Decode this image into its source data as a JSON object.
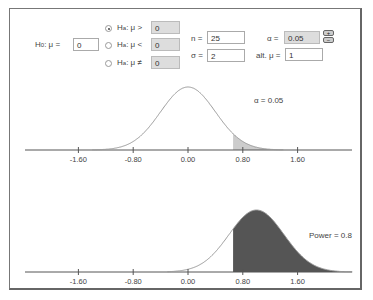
{
  "controls": {
    "h0_label": "H",
    "h0_sub": "0",
    "h0_mu": ": μ =",
    "h0_value": "0",
    "alternatives": [
      {
        "label_pre": "H",
        "label_sub": "a",
        "label_post": ": μ >",
        "value": "0",
        "selected": true
      },
      {
        "label_pre": "H",
        "label_sub": "a",
        "label_post": ": μ <",
        "value": "0",
        "selected": false
      },
      {
        "label_pre": "H",
        "label_sub": "a",
        "label_post": ": μ ≠",
        "value": "0",
        "selected": false
      }
    ],
    "n_label": "n =",
    "n_value": "25",
    "sigma_label": "σ =",
    "sigma_value": "2",
    "alpha_label": "α =",
    "alpha_value": "0.05",
    "alt_mu_label": "alt. μ =",
    "alt_mu_value": "1",
    "spin_up": "+",
    "spin_down": "−"
  },
  "chart_data": [
    {
      "type": "area",
      "title": "Null distribution",
      "distribution": "normal",
      "mean": 0,
      "sd": 0.4,
      "shaded_from": 0.658,
      "annotation": "α = 0.05",
      "x_ticks": [
        "-1.60",
        "-0.80",
        "0.00",
        "0.80",
        "1.60"
      ],
      "fill_color": "#cccccc"
    },
    {
      "type": "area",
      "title": "Alternative distribution",
      "distribution": "normal",
      "mean": 1,
      "sd": 0.4,
      "shaded_from": 0.658,
      "annotation": "Power = 0.8",
      "x_ticks": [
        "-1.60",
        "-0.80",
        "0.00",
        "0.80",
        "1.60"
      ],
      "fill_color": "#555555"
    }
  ]
}
